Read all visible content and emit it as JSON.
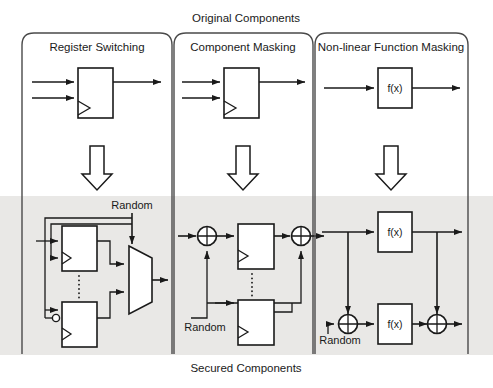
{
  "figure": {
    "top_caption": "Original Components",
    "bottom_caption": "Secured Components"
  },
  "panels": [
    {
      "id": "register-switching",
      "title": "Register Switching"
    },
    {
      "id": "component-masking",
      "title": "Component Masking"
    },
    {
      "id": "nonlinear-function-masking",
      "title": "Non-linear Function Masking"
    }
  ],
  "labels": {
    "random": "Random",
    "function_block": "f(x)"
  },
  "diagram_data": {
    "type": "block-diagram",
    "rows": [
      {
        "row": "original",
        "background": "#ffffff",
        "cells": [
          {
            "panel": "register-switching",
            "blocks": [
              {
                "kind": "register",
                "clock": true,
                "label": ""
              }
            ],
            "inputs": 2,
            "outputs": 1
          },
          {
            "panel": "component-masking",
            "blocks": [
              {
                "kind": "register",
                "clock": true,
                "label": ""
              }
            ],
            "inputs": 2,
            "outputs": 1
          },
          {
            "panel": "nonlinear-function-masking",
            "blocks": [
              {
                "kind": "function",
                "clock": false,
                "label": "f(x)"
              }
            ],
            "inputs": 1,
            "outputs": 1
          }
        ]
      },
      {
        "row": "transform",
        "element": "down-block-arrow",
        "count": 3
      },
      {
        "row": "secured",
        "background": "#e9e8e6",
        "cells": [
          {
            "panel": "register-switching",
            "blocks": [
              {
                "kind": "register",
                "clock": true,
                "inverted_input": false
              },
              {
                "kind": "register",
                "clock": true,
                "inverted_input": true
              },
              {
                "kind": "multiplexer",
                "select": "Random",
                "data_inputs": 2
              }
            ],
            "ellipsis": true,
            "random_label": "Random",
            "random_target": "multiplexer-select"
          },
          {
            "panel": "component-masking",
            "blocks": [
              {
                "kind": "xor",
                "position": "input"
              },
              {
                "kind": "register",
                "clock": true
              },
              {
                "kind": "xor",
                "position": "output"
              },
              {
                "kind": "register",
                "clock": true
              }
            ],
            "ellipsis": true,
            "random_label": "Random",
            "random_target": "both-xor-gates"
          },
          {
            "panel": "nonlinear-function-masking",
            "blocks": [
              {
                "kind": "function",
                "label": "f(x)",
                "path": "upper"
              },
              {
                "kind": "xor",
                "position": "lower-input"
              },
              {
                "kind": "function",
                "label": "f(x)",
                "path": "lower"
              },
              {
                "kind": "xor",
                "position": "lower-output"
              }
            ],
            "random_label": "Random",
            "random_target": "lower-input-xor"
          }
        ]
      }
    ]
  },
  "colors": {
    "stroke": "#1a1a1a",
    "panel_stroke": "#4a4a4a",
    "shade": "#e9e8e6",
    "background": "#ffffff"
  }
}
